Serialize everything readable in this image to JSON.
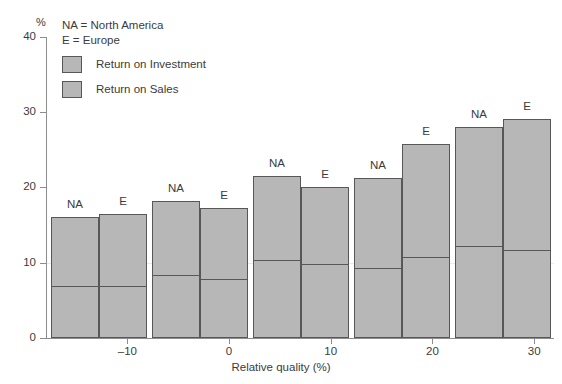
{
  "chart_data": {
    "type": "bar",
    "title": "",
    "xlabel": "Relative quality (%)",
    "ylabel": "%",
    "xlim": [
      -18,
      30
    ],
    "ylim": [
      0,
      40
    ],
    "xticks": [
      "-10",
      "0",
      "10",
      "20",
      "30"
    ],
    "yticks": [
      "0",
      "10",
      "20",
      "30",
      "40"
    ],
    "grid": "faint horizontal line at 10",
    "legend_position": "top-left",
    "notes": [
      "NA = North America",
      "E = Europe"
    ],
    "series": [
      {
        "name": "Return on Investment",
        "color": "#b7b7b7"
      },
      {
        "name": "Return on Sales",
        "color": "#b7b7b7"
      }
    ],
    "groups": [
      {
        "category": "-15",
        "bars": [
          {
            "region": "NA",
            "total": 16.1,
            "return_on_sales": 7.1
          },
          {
            "region": "E",
            "total": 16.5,
            "return_on_sales": 7.0
          }
        ]
      },
      {
        "category": "-7",
        "bars": [
          {
            "region": "NA",
            "total": 18.2,
            "return_on_sales": 8.5
          },
          {
            "region": "E",
            "total": 17.2,
            "return_on_sales": 7.9
          }
        ]
      },
      {
        "category": "3",
        "bars": [
          {
            "region": "NA",
            "total": 21.5,
            "return_on_sales": 10.5
          },
          {
            "region": "E",
            "total": 20.0,
            "return_on_sales": 9.9
          }
        ]
      },
      {
        "category": "13",
        "bars": [
          {
            "region": "NA",
            "total": 21.2,
            "return_on_sales": 9.4
          },
          {
            "region": "E",
            "total": 25.7,
            "return_on_sales": 10.9
          }
        ]
      },
      {
        "category": "24",
        "bars": [
          {
            "region": "NA",
            "total": 28.0,
            "return_on_sales": 12.3
          },
          {
            "region": "E",
            "total": 29.1,
            "return_on_sales": 11.8
          }
        ]
      }
    ]
  },
  "axis": {
    "y_unit": "%",
    "x_title": "Relative quality (%)",
    "y_tick_labels": [
      "0",
      "10",
      "20",
      "30",
      "40"
    ],
    "x_tick_labels": [
      "-10",
      "0",
      "10",
      "20",
      "30"
    ]
  },
  "legend": {
    "note_na": "NA = North America",
    "note_e": "E = Europe",
    "entries": [
      {
        "label": "Return on Investment"
      },
      {
        "label": "Return on Sales"
      }
    ]
  },
  "colors": {
    "bar_fill": "#b7b7b7",
    "bar_stroke": "#575757",
    "axis": "#8d8d8d",
    "text": "#3b3b3b",
    "gridline": "#efe9ea"
  }
}
